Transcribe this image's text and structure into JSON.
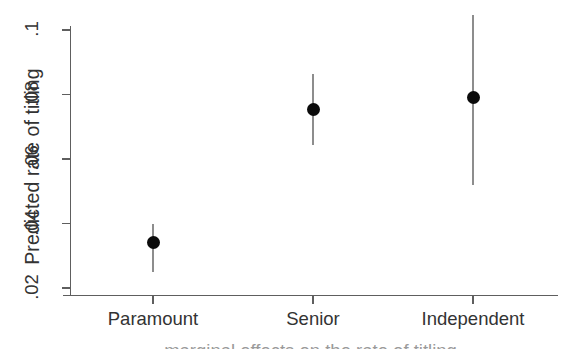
{
  "chart_data": {
    "type": "scatter",
    "title": "",
    "subtitle": "",
    "xlabel": "",
    "ylabel": "Predicted rate of titling",
    "xcaption_clipped": "marginal effects on the rate of titling",
    "categories": [
      "Paramount",
      "Senior",
      "Independent"
    ],
    "values": [
      0.034,
      0.0753,
      0.079
    ],
    "ci_low": [
      0.025,
      0.0642,
      0.0518
    ],
    "ci_high": [
      0.04,
      0.0865,
      0.1046
    ],
    "series": [
      {
        "name": "Predicted rate of titling",
        "points": [
          {
            "category": "Paramount",
            "value": 0.034,
            "ci_low": 0.025,
            "ci_high": 0.04
          },
          {
            "category": "Senior",
            "value": 0.0753,
            "ci_low": 0.0642,
            "ci_high": 0.0865
          },
          {
            "category": "Independent",
            "value": 0.079,
            "ci_low": 0.0518,
            "ci_high": 0.1046
          }
        ]
      }
    ],
    "ytick_labels": [
      ".02",
      ".04",
      ".06",
      ".08",
      ".1"
    ],
    "ytick_values": [
      0.02,
      0.04,
      0.06,
      0.08,
      0.1
    ],
    "ylim": [
      0.0164,
      0.1004
    ],
    "xlim": [
      0,
      4
    ],
    "grid": false,
    "legend": false,
    "legend_position": "none",
    "marker_color": "#0b0b0b",
    "errorbar_color": "#8d8d8d",
    "axis_color": "#5e5e5e"
  }
}
